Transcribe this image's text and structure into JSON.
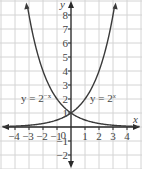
{
  "chart_data": {
    "type": "line",
    "title": "",
    "xlabel": "x",
    "ylabel": "y",
    "xlim": [
      -5,
      5
    ],
    "ylim": [
      -3,
      9
    ],
    "grid": true,
    "x_ticks": [
      -4,
      -3,
      -2,
      -1,
      1,
      2,
      3,
      4
    ],
    "y_ticks": [
      -2,
      -1,
      1,
      2,
      3,
      4,
      5,
      6,
      7,
      8
    ],
    "origin_label": "0",
    "series": [
      {
        "name": "y = 2^-x",
        "label_text": "y = 2",
        "exponent": "−x",
        "x": [
          -4,
          -3,
          -2,
          -1,
          0,
          1,
          2,
          3,
          4
        ],
        "values": [
          16,
          8,
          4,
          2,
          1,
          0.5,
          0.25,
          0.125,
          0.0625
        ]
      },
      {
        "name": "y = 2^x",
        "label_text": "y = 2",
        "exponent": "x",
        "x": [
          -4,
          -3,
          -2,
          -1,
          0,
          1,
          2,
          3,
          4
        ],
        "values": [
          0.0625,
          0.125,
          0.25,
          0.5,
          1,
          2,
          4,
          8,
          16
        ]
      }
    ],
    "intersection": [
      0,
      1
    ],
    "colors": {
      "curve": "#3a3a3a",
      "grid": "#d4d4d4",
      "axis": "#2a2a2a",
      "text": "#444444"
    }
  }
}
